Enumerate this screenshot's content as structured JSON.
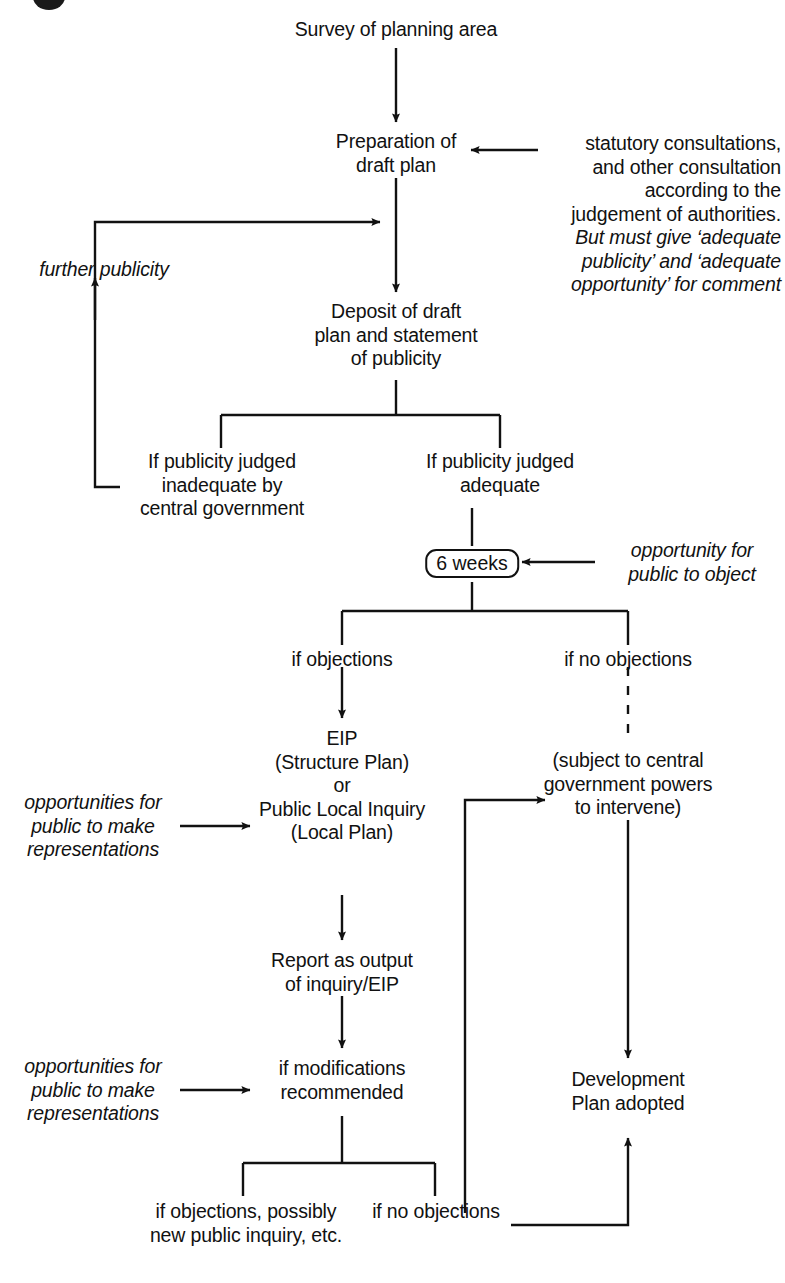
{
  "figure": {
    "type": "flowchart",
    "caption": ""
  },
  "nodes": {
    "survey": "Survey of planning area",
    "preparation": "Preparation of\ndraft plan",
    "deposit": "Deposit of draft\nplan and statement\nof publicity",
    "publicity_inadequate": "If publicity judged\ninadequate by\ncentral government",
    "publicity_adequate": "If publicity judged\nadequate",
    "six_weeks": "6 weeks",
    "if_objections": "if objections",
    "if_no_objections": "if no objections",
    "eip": "EIP\n(Structure Plan)\nor\nPublic Local Inquiry\n(Local Plan)",
    "subject_to_central": "(subject to central\ngovernment powers\nto intervene)",
    "report": "Report as output\nof inquiry/EIP",
    "modifications": "if modifications\nrecommended",
    "objections_possibly": "if objections, possibly\nnew public inquiry, etc.",
    "no_objections_bottom": "if no objections",
    "development_plan": "Development\nPlan adopted"
  },
  "annotations": {
    "further_publicity": "further publicity",
    "statutory_upright": "statutory consultations,\nand other consultation\naccording to the\njudgement of authorities.",
    "statutory_italic": "But must give ‘adequate\npublicity’ and ‘adequate\nopportunity’ for comment",
    "opportunity_object": "opportunity for\npublic to object",
    "opportunities_rep_1": "opportunities for\npublic to make\nrepresentations",
    "opportunities_rep_2": "opportunities for\npublic to make\nrepresentations"
  },
  "style": {
    "line_color": "#111111",
    "text_color": "#111111",
    "background": "#ffffff"
  }
}
